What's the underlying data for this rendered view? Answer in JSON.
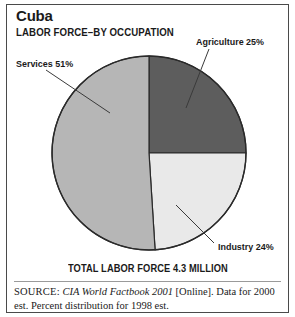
{
  "figure": {
    "title": "Cuba",
    "subtitle": "LABOR FORCE–BY OCCUPATION",
    "total_caption": "TOTAL LABOR FORCE 4.3 MILLION"
  },
  "source": {
    "keyword": "SOURCE:",
    "publication": "CIA World Factbook 2001",
    "rest": " [Online]. Data for 2000 est. Percent distribution for 1998 est."
  },
  "labels": {
    "services": "Services 51%",
    "agriculture": "Agriculture 25%",
    "industry": "Industry 24%"
  },
  "colors": {
    "agriculture": "#5d5d5d",
    "industry": "#e9e9e9",
    "services": "#b6b6b6",
    "outline": "#2a2a2a",
    "text": "#1a1a1a",
    "background": "#ffffff"
  },
  "chart_data": {
    "type": "pie",
    "subtitle": "TOTAL LABOR FORCE 4.3 MILLION",
    "unit": "percent",
    "total_labor_force": "4.3 million",
    "start_angle_deg": 0,
    "direction": "clockwise",
    "legend": "none (direct leader-line labels)",
    "categories": [
      "Agriculture",
      "Industry",
      "Services"
    ],
    "values": [
      25,
      24,
      51
    ],
    "slices": [
      {
        "name": "Agriculture",
        "value": 25,
        "label": "Agriculture 25%",
        "color": "#5d5d5d",
        "start_deg": 0,
        "end_deg": 90
      },
      {
        "name": "Industry",
        "value": 24,
        "label": "Industry 24%",
        "color": "#e9e9e9",
        "start_deg": 90,
        "end_deg": 176.4
      },
      {
        "name": "Services",
        "value": 51,
        "label": "Services 51%",
        "color": "#b6b6b6",
        "start_deg": 176.4,
        "end_deg": 360
      }
    ],
    "annotations": [
      "Data for 2000 est.",
      "Percent distribution for 1998 est."
    ]
  }
}
